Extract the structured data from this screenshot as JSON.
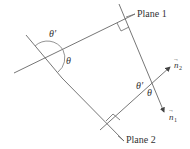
{
  "diagram": {
    "labels": {
      "plane1": "Plane 1",
      "plane2": "Plane 2",
      "theta_left": "θ",
      "theta_prime_left": "θ′",
      "theta_right": "θ",
      "theta_prime_right": "θ′",
      "n1": "n",
      "n1_sub": "1",
      "n2": "n",
      "n2_sub": "2",
      "vector_arrow": "→"
    },
    "colors": {
      "line": "#555555",
      "text": "#333333",
      "background": "#ffffff"
    }
  }
}
